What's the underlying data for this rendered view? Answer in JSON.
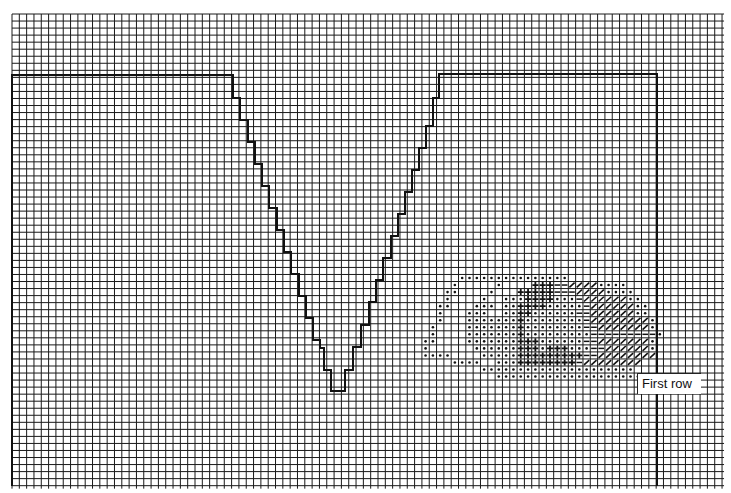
{
  "diagram": {
    "type": "knitting-chart",
    "grid": {
      "origin_x": 12,
      "origin_y": 14,
      "cell_w": 7.32,
      "cell_h": 7.04,
      "cols": 97,
      "rows": 67,
      "line_color": "#1a1a1a"
    },
    "outline": {
      "description": "Thick outline with stepped V-neck cut",
      "color": "#111111",
      "stroke_width": 2,
      "points": [
        [
          12,
          486
        ],
        [
          12,
          75
        ],
        [
          233,
          75
        ],
        [
          233,
          98
        ],
        [
          240,
          98
        ],
        [
          240,
          120
        ],
        [
          248,
          120
        ],
        [
          248,
          142
        ],
        [
          255,
          142
        ],
        [
          255,
          164
        ],
        [
          262,
          164
        ],
        [
          262,
          186
        ],
        [
          269,
          186
        ],
        [
          269,
          208
        ],
        [
          277,
          208
        ],
        [
          277,
          230
        ],
        [
          284,
          230
        ],
        [
          284,
          252
        ],
        [
          291,
          252
        ],
        [
          291,
          274
        ],
        [
          299,
          274
        ],
        [
          299,
          296
        ],
        [
          306,
          296
        ],
        [
          306,
          318
        ],
        [
          313,
          318
        ],
        [
          313,
          340
        ],
        [
          320,
          340
        ],
        [
          320,
          348
        ],
        [
          324,
          348
        ],
        [
          324,
          370
        ],
        [
          331,
          370
        ],
        [
          331,
          391
        ],
        [
          345,
          391
        ],
        [
          345,
          370
        ],
        [
          353,
          370
        ],
        [
          353,
          347
        ],
        [
          361,
          347
        ],
        [
          361,
          325
        ],
        [
          369,
          325
        ],
        [
          369,
          302
        ],
        [
          376,
          302
        ],
        [
          376,
          280
        ],
        [
          383,
          280
        ],
        [
          383,
          258
        ],
        [
          391,
          258
        ],
        [
          391,
          236
        ],
        [
          398,
          236
        ],
        [
          398,
          214
        ],
        [
          405,
          214
        ],
        [
          405,
          192
        ],
        [
          412,
          192
        ],
        [
          412,
          170
        ],
        [
          419,
          170
        ],
        [
          419,
          148
        ],
        [
          426,
          148
        ],
        [
          426,
          126
        ],
        [
          433,
          126
        ],
        [
          433,
          98
        ],
        [
          439,
          98
        ],
        [
          439,
          74
        ],
        [
          657,
          74
        ],
        [
          657,
          486
        ]
      ]
    },
    "pattern": {
      "legend": {
        ".": "dot",
        "+": "plus",
        "-": "dash",
        "/": "slash"
      },
      "start_col": 55,
      "start_row": 37,
      "rows": [
        "      ...............          ",
        "     .     .    +++--////....  ",
        "    ..    .   +++++---////.... ",
        "    .    .  ...++++...-//////..",
        "   ..   ... ..++++.....-//////.. ",
        "   .   ...  ..++......--//////..",
        "   .   .......+........-////////.",
        "  .    .......+........--///////.",
        "  .    .......+.........---------.",
        " ..    .......+++......--///////.",
        " .      ......+++.+++...--//////.",
        " ....    .....+++++++++--////////",
        "     ....  ...++++++++-//////// ",
        "         .....................  ",
        "           .................... ",
        "                                 ",
        "                                 "
      ]
    },
    "label": {
      "text": "First row",
      "x": 637,
      "y": 373,
      "w": 64,
      "h": 21
    }
  }
}
